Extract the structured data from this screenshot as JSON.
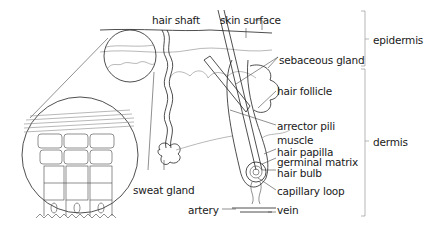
{
  "diagram": {
    "labels": {
      "hair_shaft": "hair shaft",
      "skin_surface": "skin surface",
      "sebaceous_gland": "sebaceous gland",
      "hair_follicle": "hair follicle",
      "arrector_pili": "arrector pili",
      "muscle": "muscle",
      "hair_papilla": "hair papilla",
      "germinal_matrix": "germinal matrix",
      "hair_bulb": "hair bulb",
      "capillary_loop": "capillary loop",
      "artery": "artery",
      "vein": "vein",
      "sweat_gland": "sweat gland"
    },
    "layers": {
      "epidermis": "epidermis",
      "dermis": "dermis"
    }
  }
}
